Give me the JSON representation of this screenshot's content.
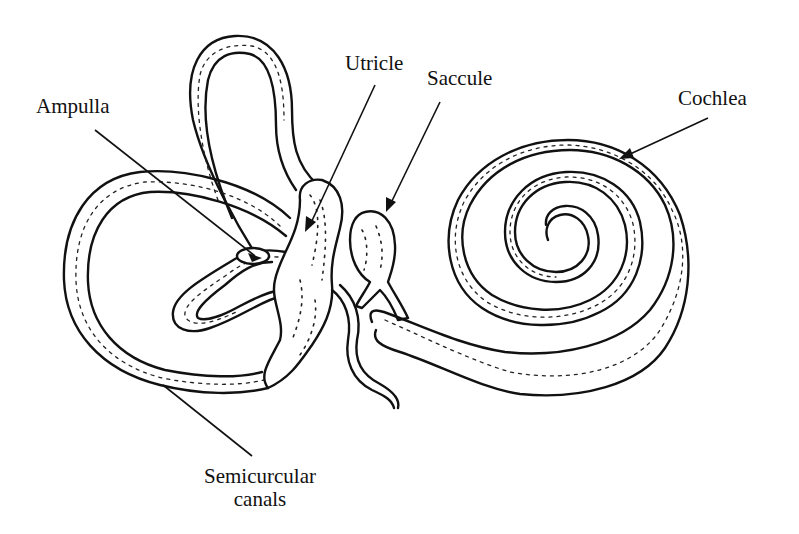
{
  "diagram": {
    "colors": {
      "ink": "#111111",
      "background": "#ffffff"
    },
    "labels": {
      "ampulla": "Ampulla",
      "utricle": "Utricle",
      "saccule": "Saccule",
      "cochlea": "Cochlea",
      "semicircular_line1": "Semicurcular",
      "semicircular_line2": "canals"
    },
    "structures": [
      {
        "name": "semicircular-canals",
        "label": "Semicurcular canals"
      },
      {
        "name": "ampulla",
        "label": "Ampulla"
      },
      {
        "name": "utricle",
        "label": "Utricle"
      },
      {
        "name": "saccule",
        "label": "Saccule"
      },
      {
        "name": "cochlea",
        "label": "Cochlea"
      }
    ]
  }
}
